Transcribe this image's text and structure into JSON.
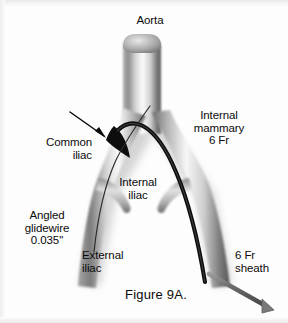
{
  "figure": {
    "caption": "Figure 9A.",
    "background_color": "#fdfdfd",
    "ink_color": "#0b0b0b",
    "vessel_light": "#fcfcfc",
    "vessel_mid": "#9a9a9a",
    "vessel_dark": "#4a4a4a",
    "device_color": "#111111",
    "sheath_color": "#6e6e6e"
  },
  "labels": {
    "aorta": "Aorta",
    "internal_mammary": "Internal\nmammary\n6 Fr",
    "common_iliac": "Common\niliac",
    "internal_iliac": "Internal\niliac",
    "angled_glidewire": "Angled\nglidewire\n0.035\"",
    "external_iliac": "External\niliac",
    "sheath": "6 Fr\nsheath"
  },
  "annotations": {
    "lesion_arrow": "arrow-pointing-to-stenosis",
    "lesion": "left-common-iliac-stenosis"
  }
}
